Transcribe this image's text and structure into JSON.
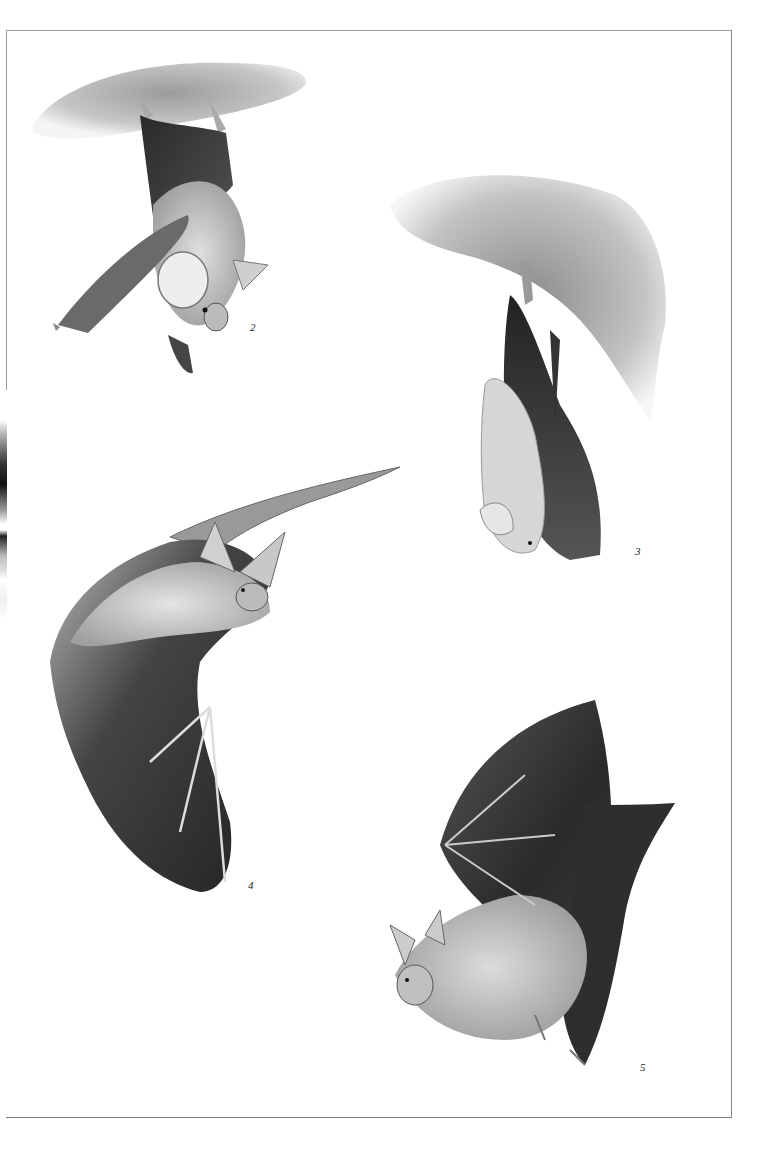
{
  "plate": {
    "type": "scientific illustration plate",
    "subject": "bats",
    "figures": [
      {
        "number": "2",
        "description": "Bat hanging upside down from a rock ledge, large ears, wings folded"
      },
      {
        "number": "3",
        "description": "Bat hanging from rocky overhang, wings wrapped around body"
      },
      {
        "number": "4",
        "description": "Bat in flight with wing extended, large ears and nose leaf"
      },
      {
        "number": "5",
        "description": "Bat in flight, wings raised, viewed from side"
      }
    ]
  },
  "colors": {
    "ink": "#1a1a1a",
    "mid": "#6a6a6a",
    "light": "#c8c8c8",
    "paper": "#ffffff"
  }
}
